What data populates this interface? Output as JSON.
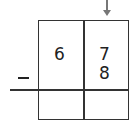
{
  "problem": {
    "operation": "subtraction",
    "operator_symbol": "−",
    "top_row": {
      "tens": "6",
      "ones": "7"
    },
    "bottom_row": {
      "tens": "",
      "ones": "8"
    },
    "answer_row": {
      "tens": "",
      "ones": ""
    },
    "arrow_points_to": "ones column"
  }
}
